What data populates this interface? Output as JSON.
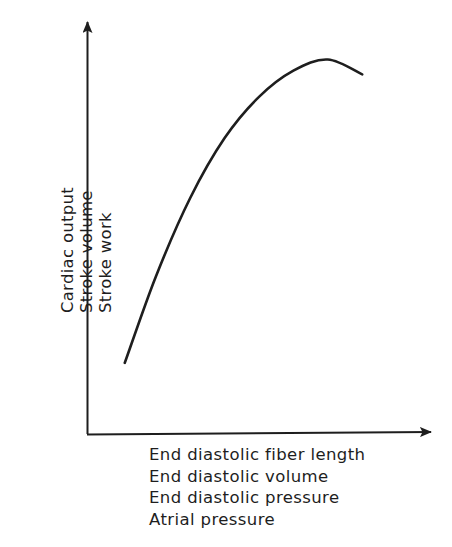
{
  "chart_data": {
    "type": "line",
    "title": "",
    "xlabel_lines": [
      "End diastolic fiber length",
      "End diastolic volume",
      "End diastolic pressure",
      "Atrial pressure"
    ],
    "ylabel_lines": [
      "Cardiac output",
      "Stroke volume",
      "Stroke work"
    ],
    "xlabel": "End diastolic fiber length / End diastolic volume / End diastolic pressure / Atrial pressure",
    "ylabel": "Cardiac output / Stroke volume / Stroke work",
    "grid": false,
    "ticks": false,
    "legend": null,
    "axis_style": "arrows, no tick marks or numeric values",
    "series": [
      {
        "name": "Frank-Starling curve",
        "description": "Qualitative ventricular function curve: steep rise, plateau, slight decline",
        "x": [
          0.11,
          0.2,
          0.3,
          0.4,
          0.5,
          0.6,
          0.7,
          0.8
        ],
        "y": [
          0.19,
          0.42,
          0.63,
          0.79,
          0.9,
          0.97,
          1.0,
          0.96
        ]
      }
    ],
    "xlim": [
      0,
      1
    ],
    "ylim": [
      0,
      1.1
    ]
  },
  "colors": {
    "ink": "#1e1e1e",
    "background": "#ffffff"
  }
}
